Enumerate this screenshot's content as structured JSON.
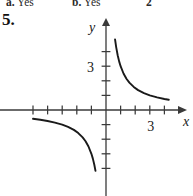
{
  "answers_line": {
    "items": [
      {
        "label": "a.",
        "text": "Yes"
      },
      {
        "label": "b.",
        "text": "Yes"
      },
      {
        "label": "2",
        "text": ""
      }
    ]
  },
  "problem": {
    "number": "5."
  },
  "chart_data": {
    "type": "line",
    "title": "",
    "subtitle": "",
    "xlabel": "x",
    "ylabel": "y",
    "xlim": [
      -5,
      5
    ],
    "ylim": [
      -5,
      5
    ],
    "grid": false,
    "legend": null,
    "annotations": [],
    "x_tick_labels": [
      {
        "value": 3,
        "text": "3"
      }
    ],
    "y_tick_labels": [
      {
        "value": 3,
        "text": "3"
      }
    ],
    "x_ticks": [
      -5,
      -4,
      -3,
      -2,
      -1,
      1,
      2,
      3,
      4
    ],
    "y_ticks": [
      -4,
      -3,
      -2,
      -1,
      1,
      2,
      3,
      4
    ],
    "axis_arrows": [
      "x-positive",
      "y-positive"
    ],
    "series": [
      {
        "name": "branch-upper-right",
        "equation": "y = 3/x",
        "quadrant": "I",
        "x_start": 0.62,
        "x_end": 4.3,
        "points": [
          [
            0.62,
            4.84
          ],
          [
            0.7,
            4.29
          ],
          [
            0.8,
            3.75
          ],
          [
            0.9,
            3.33
          ],
          [
            1.0,
            3.0
          ],
          [
            1.2,
            2.5
          ],
          [
            1.4,
            2.14
          ],
          [
            1.6,
            1.88
          ],
          [
            1.9,
            1.58
          ],
          [
            2.2,
            1.36
          ],
          [
            2.6,
            1.15
          ],
          [
            3.0,
            1.0
          ],
          [
            3.5,
            0.86
          ],
          [
            4.0,
            0.75
          ],
          [
            4.3,
            0.7
          ]
        ]
      },
      {
        "name": "branch-lower-left",
        "equation": "y = 3/x",
        "quadrant": "III",
        "x_start": -5.0,
        "x_end": -0.7,
        "points": [
          [
            -5.0,
            -0.6
          ],
          [
            -4.5,
            -0.67
          ],
          [
            -4.0,
            -0.75
          ],
          [
            -3.5,
            -0.86
          ],
          [
            -3.0,
            -1.0
          ],
          [
            -2.6,
            -1.15
          ],
          [
            -2.2,
            -1.36
          ],
          [
            -1.9,
            -1.58
          ],
          [
            -1.6,
            -1.88
          ],
          [
            -1.4,
            -2.14
          ],
          [
            -1.2,
            -2.5
          ],
          [
            -1.0,
            -3.0
          ],
          [
            -0.9,
            -3.33
          ],
          [
            -0.8,
            -3.75
          ],
          [
            -0.72,
            -4.17
          ]
        ]
      }
    ],
    "colors": {
      "curve": "#1a1a1a",
      "axis": "#3a3a3a",
      "background": "#ffffff"
    }
  }
}
